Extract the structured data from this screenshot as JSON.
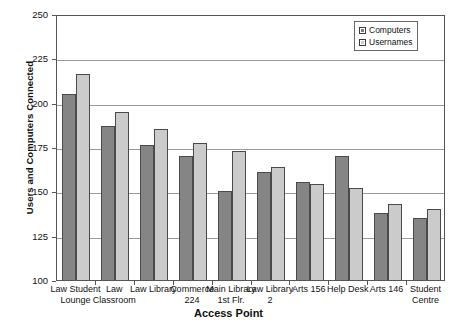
{
  "chart_data": {
    "type": "bar",
    "title": "",
    "xlabel": "Access Point",
    "ylabel": "Users and Computers Connected",
    "ylim": [
      100,
      250
    ],
    "yticks": [
      100,
      125,
      150,
      175,
      200,
      225,
      250
    ],
    "grid": true,
    "legend_position": "top-right",
    "categories": [
      "Law Student Lounge",
      "Law Classroom",
      "Law Library",
      "Commerce 224",
      "Main Library 1st Flr.",
      "Law Library 2",
      "Arts 156",
      "Help Desk",
      "Arts 146",
      "Student Centre"
    ],
    "category_lines": [
      [
        "Law Student",
        "Lounge"
      ],
      [
        "Law",
        "Classroom"
      ],
      [
        "Law Library",
        ""
      ],
      [
        "Commerce",
        "224"
      ],
      [
        "Main Library",
        "1st Flr."
      ],
      [
        "Law Library",
        "2"
      ],
      [
        "Arts 156",
        ""
      ],
      [
        "Help Desk",
        ""
      ],
      [
        "Arts 146",
        ""
      ],
      [
        "Student",
        "Centre"
      ]
    ],
    "series": [
      {
        "name": "Computers",
        "color": "#858585",
        "values": [
          205,
          187,
          176,
          170,
          150,
          161,
          155,
          170,
          138,
          135
        ]
      },
      {
        "name": "Usernames",
        "color": "#cbcbcb",
        "values": [
          216,
          195,
          185,
          177,
          173,
          164,
          154,
          152,
          143,
          140
        ]
      }
    ]
  },
  "legend": {
    "items": [
      {
        "label": "Computers"
      },
      {
        "label": "Usernames"
      }
    ]
  },
  "axis": {
    "y_title": "Users and Computers Connected",
    "x_title": "Access Point",
    "y_tick_labels": [
      "250",
      "225",
      "200",
      "175",
      "150",
      "125",
      "100"
    ]
  },
  "colors": {
    "computers": "#858585",
    "usernames": "#cbcbcb",
    "grid": "#9a9a9a",
    "frame": "#555555"
  }
}
